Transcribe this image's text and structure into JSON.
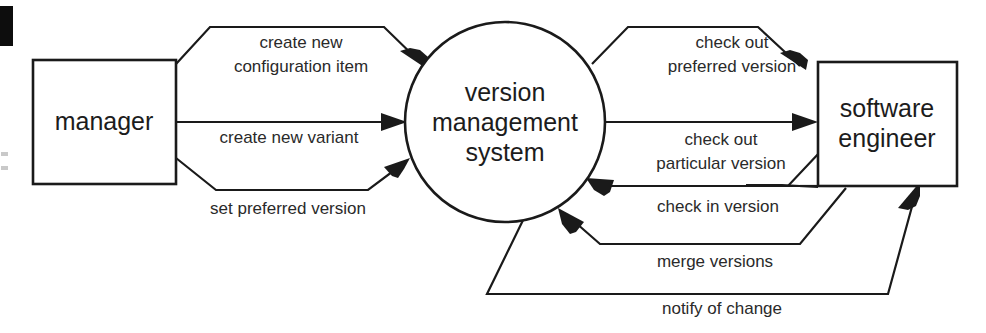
{
  "diagram": {
    "type": "data-flow-diagram",
    "colors": {
      "stroke": "#1a1a1a",
      "background": "#ffffff",
      "text": "#1c1c1c",
      "label_text": "#2a2a2a"
    },
    "nodes": [
      {
        "id": "manager",
        "shape": "rectangle",
        "label": "manager",
        "lines": [
          "manager"
        ]
      },
      {
        "id": "version-management-system",
        "shape": "circle",
        "label": "version management system",
        "lines": [
          "version",
          "management",
          "system"
        ]
      },
      {
        "id": "software-engineer",
        "shape": "rectangle",
        "label": "software engineer",
        "lines": [
          "software",
          "engineer"
        ]
      }
    ],
    "flows": [
      {
        "id": "create-new-configuration-item",
        "label": "create new configuration item",
        "lines": [
          "create new",
          "configuration item"
        ],
        "from": "manager",
        "to": "version-management-system",
        "direction": "left-to-right"
      },
      {
        "id": "create-new-variant",
        "label": "create new variant",
        "lines": [
          "create new variant"
        ],
        "from": "manager",
        "to": "version-management-system",
        "direction": "left-to-right"
      },
      {
        "id": "set-preferred-version",
        "label": "set preferred version",
        "lines": [
          "set preferred version"
        ],
        "from": "manager",
        "to": "version-management-system",
        "direction": "left-to-right"
      },
      {
        "id": "check-out-preferred-version",
        "label": "check out preferred version",
        "lines": [
          "check out",
          "preferred version"
        ],
        "from": "version-management-system",
        "to": "software-engineer",
        "direction": "left-to-right"
      },
      {
        "id": "check-out-particular-version",
        "label": "check out particular version",
        "lines": [
          "check out",
          "particular version"
        ],
        "from": "version-management-system",
        "to": "software-engineer",
        "direction": "left-to-right"
      },
      {
        "id": "check-in-version",
        "label": "check in version",
        "lines": [
          "check in version"
        ],
        "from": "software-engineer",
        "to": "version-management-system",
        "direction": "right-to-left"
      },
      {
        "id": "merge-versions",
        "label": "merge versions",
        "lines": [
          "merge versions"
        ],
        "from": "software-engineer",
        "to": "version-management-system",
        "direction": "right-to-left"
      },
      {
        "id": "notify-of-change",
        "label": "notify of change",
        "lines": [
          "notify of change"
        ],
        "from": "version-management-system",
        "to": "software-engineer",
        "direction": "left-to-right"
      }
    ]
  }
}
